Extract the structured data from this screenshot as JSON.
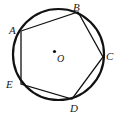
{
  "figure": {
    "type": "circle-inscribed-polygon",
    "canvas": {
      "width": 120,
      "height": 117
    },
    "background_color": "#ffffff",
    "stroke_color": "#111111",
    "label_color": "#1a1a1a",
    "circle": {
      "name": "circumscribed-circle",
      "center": {
        "x": 58.5,
        "y": 54.5
      },
      "radius": 45.5,
      "stroke_width": 2.2
    },
    "center_point": {
      "name": "center-point-O",
      "x": 54.5,
      "y": 51.5,
      "radius": 1.6,
      "label": "O",
      "label_x": 57,
      "label_y": 53.5
    },
    "vertices": [
      {
        "id": "A",
        "label": "A",
        "x": 21.0,
        "y": 31.0,
        "label_x": 9,
        "label_y": 24.5
      },
      {
        "id": "B",
        "label": "B",
        "x": 78.0,
        "y": 12.0,
        "label_x": 73,
        "label_y": 1.5
      },
      {
        "id": "C",
        "label": "C",
        "x": 103.0,
        "y": 57.0,
        "label_x": 106,
        "label_y": 51
      },
      {
        "id": "D",
        "label": "D",
        "x": 72.0,
        "y": 99.0,
        "label_x": 70,
        "label_y": 103
      },
      {
        "id": "E",
        "label": "E",
        "x": 21.0,
        "y": 84.0,
        "label_x": 6,
        "label_y": 79
      }
    ],
    "edges": [
      {
        "name": "chord-AB",
        "from": "A",
        "to": "B",
        "stroke_width": 1.3
      },
      {
        "name": "chord-BC",
        "from": "B",
        "to": "C",
        "stroke_width": 1.3
      },
      {
        "name": "chord-CD",
        "from": "C",
        "to": "D",
        "stroke_width": 1.3
      },
      {
        "name": "chord-DE",
        "from": "D",
        "to": "E",
        "stroke_width": 1.3
      },
      {
        "name": "chord-EA",
        "from": "E",
        "to": "A",
        "stroke_width": 1.3
      }
    ]
  }
}
